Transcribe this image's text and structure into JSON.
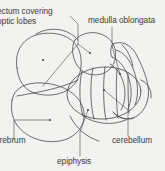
{
  "figure": {
    "background_color": "#f2f2f0",
    "stroke_color": "#4a4a4a",
    "text_color": "#3a3a3a",
    "labels": [
      {
        "id": "tectum",
        "line1": "ectum covering",
        "line2": "optic lobes",
        "full": "tectum covering optic lobes",
        "clipped_left": true
      },
      {
        "id": "medulla",
        "text": "medulla oblongata"
      },
      {
        "id": "cerebrum",
        "text": "erebrum",
        "full": "cerebrum",
        "clipped_left": true
      },
      {
        "id": "cerebellum",
        "text": "cerebellum"
      },
      {
        "id": "epiphysis",
        "text": "epiphysis"
      }
    ]
  }
}
